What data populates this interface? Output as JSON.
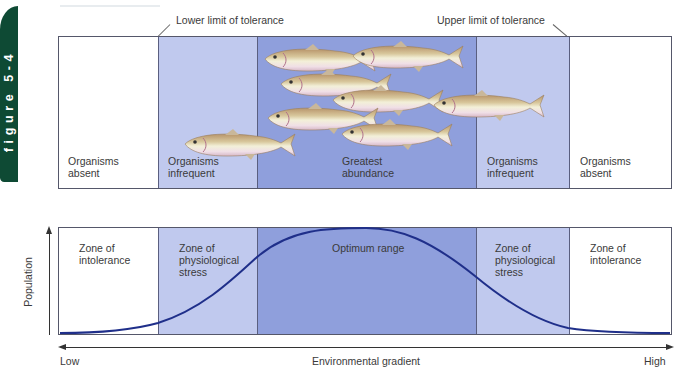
{
  "figure_tab": {
    "label": "figure 5-4",
    "color": "#0e4a34"
  },
  "limits": {
    "lower": "Lower limit of tolerance",
    "upper": "Upper limit of tolerance"
  },
  "top_panel": {
    "zones": [
      {
        "label_line1": "Organisms",
        "label_line2": "absent",
        "color": "#ffffff"
      },
      {
        "label_line1": "Organisms",
        "label_line2": "infrequent",
        "color": "#c0c9ee"
      },
      {
        "label_line1": "Greatest",
        "label_line2": "abundance",
        "color": "#8f9fdc"
      },
      {
        "label_line1": "Organisms",
        "label_line2": "infrequent",
        "color": "#c0c9ee"
      },
      {
        "label_line1": "Organisms",
        "label_line2": "absent",
        "color": "#ffffff"
      }
    ],
    "fish_count": 8
  },
  "bottom_panel": {
    "zones": [
      {
        "line1": "Zone of",
        "line2": "intolerance",
        "line3": ""
      },
      {
        "line1": "Zone of",
        "line2": "physiological",
        "line3": "stress"
      },
      {
        "line1": "Optimum range",
        "line2": "",
        "line3": ""
      },
      {
        "line1": "Zone of",
        "line2": "physiological",
        "line3": "stress"
      },
      {
        "line1": "Zone of",
        "line2": "intolerance",
        "line3": ""
      }
    ],
    "curve_color": "#1f2f8a"
  },
  "axes": {
    "y_label": "Population",
    "x_label": "Environmental gradient",
    "x_low": "Low",
    "x_high": "High"
  }
}
